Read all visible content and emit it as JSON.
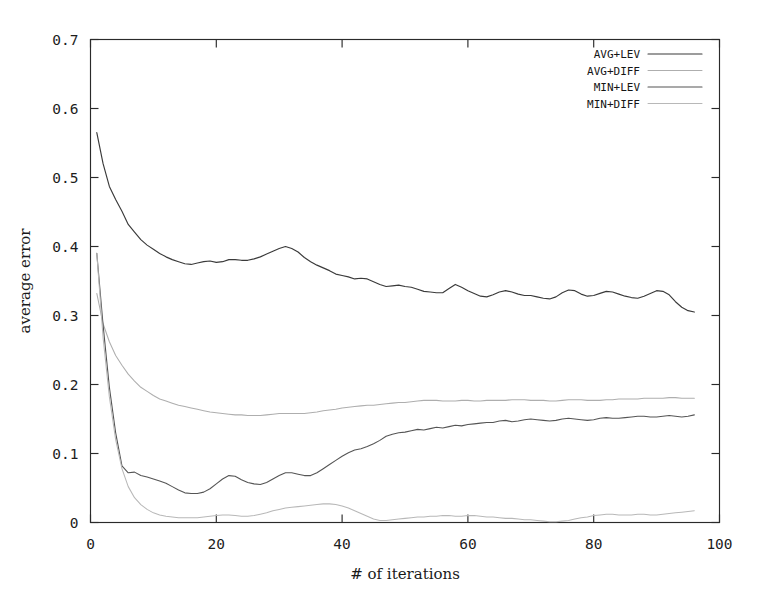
{
  "chart_data": {
    "type": "line",
    "title": "",
    "xlabel": "# of iterations",
    "ylabel": "average error",
    "xlim": [
      0,
      100
    ],
    "ylim": [
      0,
      0.7
    ],
    "xticks": [
      "0",
      "20",
      "40",
      "60",
      "80",
      "100"
    ],
    "xtick_values": [
      0,
      20,
      40,
      60,
      80,
      100
    ],
    "yticks": [
      "0",
      "0.1",
      "0.2",
      "0.3",
      "0.4",
      "0.5",
      "0.6",
      "0.7"
    ],
    "ytick_values": [
      0,
      0.1,
      0.2,
      0.3,
      0.4,
      0.5,
      0.6,
      0.7
    ],
    "grid": false,
    "legend_position": "top-right",
    "x": [
      1,
      2,
      3,
      4,
      5,
      6,
      7,
      8,
      9,
      10,
      11,
      12,
      13,
      14,
      15,
      16,
      17,
      18,
      19,
      20,
      21,
      22,
      23,
      24,
      25,
      26,
      27,
      28,
      29,
      30,
      31,
      32,
      33,
      34,
      35,
      36,
      37,
      38,
      39,
      40,
      41,
      42,
      43,
      44,
      45,
      46,
      47,
      48,
      49,
      50,
      51,
      52,
      53,
      54,
      55,
      56,
      57,
      58,
      59,
      60,
      61,
      62,
      63,
      64,
      65,
      66,
      67,
      68,
      69,
      70,
      71,
      72,
      73,
      74,
      75,
      76,
      77,
      78,
      79,
      80,
      81,
      82,
      83,
      84,
      85,
      86,
      87,
      88,
      89,
      90,
      91,
      92,
      93,
      94,
      95,
      96
    ],
    "series": [
      {
        "name": "AVG+LEV",
        "color": "#3a3a3a",
        "width": 1.15,
        "values": [
          0.565,
          0.52,
          0.487,
          0.468,
          0.451,
          0.432,
          0.421,
          0.41,
          0.402,
          0.396,
          0.39,
          0.385,
          0.381,
          0.378,
          0.375,
          0.374,
          0.376,
          0.378,
          0.379,
          0.377,
          0.378,
          0.381,
          0.381,
          0.38,
          0.38,
          0.382,
          0.385,
          0.389,
          0.393,
          0.397,
          0.4,
          0.397,
          0.392,
          0.384,
          0.378,
          0.373,
          0.369,
          0.365,
          0.36,
          0.358,
          0.356,
          0.353,
          0.354,
          0.353,
          0.349,
          0.345,
          0.342,
          0.343,
          0.344,
          0.342,
          0.341,
          0.338,
          0.335,
          0.334,
          0.333,
          0.333,
          0.339,
          0.345,
          0.341,
          0.336,
          0.332,
          0.328,
          0.327,
          0.33,
          0.334,
          0.336,
          0.334,
          0.331,
          0.329,
          0.329,
          0.327,
          0.325,
          0.324,
          0.327,
          0.333,
          0.337,
          0.336,
          0.331,
          0.328,
          0.329,
          0.332,
          0.335,
          0.334,
          0.331,
          0.328,
          0.326,
          0.325,
          0.328,
          0.332,
          0.336,
          0.335,
          0.33,
          0.32,
          0.312,
          0.307,
          0.305
        ]
      },
      {
        "name": "AVG+DIFF",
        "color": "#aeaeae",
        "width": 1.05,
        "values": [
          0.332,
          0.288,
          0.262,
          0.242,
          0.228,
          0.215,
          0.205,
          0.196,
          0.19,
          0.184,
          0.179,
          0.176,
          0.173,
          0.17,
          0.168,
          0.166,
          0.164,
          0.162,
          0.16,
          0.159,
          0.158,
          0.157,
          0.156,
          0.156,
          0.155,
          0.155,
          0.155,
          0.156,
          0.157,
          0.158,
          0.158,
          0.158,
          0.158,
          0.158,
          0.159,
          0.16,
          0.162,
          0.163,
          0.164,
          0.166,
          0.167,
          0.168,
          0.169,
          0.17,
          0.17,
          0.171,
          0.172,
          0.173,
          0.174,
          0.174,
          0.175,
          0.176,
          0.177,
          0.177,
          0.177,
          0.176,
          0.176,
          0.176,
          0.177,
          0.177,
          0.176,
          0.176,
          0.177,
          0.177,
          0.177,
          0.177,
          0.178,
          0.178,
          0.178,
          0.177,
          0.177,
          0.177,
          0.176,
          0.176,
          0.177,
          0.178,
          0.178,
          0.178,
          0.177,
          0.177,
          0.177,
          0.178,
          0.178,
          0.179,
          0.179,
          0.179,
          0.179,
          0.18,
          0.18,
          0.18,
          0.18,
          0.181,
          0.181,
          0.18,
          0.18,
          0.18
        ]
      },
      {
        "name": "MIN+LEV",
        "color": "#555555",
        "width": 1.1,
        "values": [
          0.39,
          0.286,
          0.196,
          0.13,
          0.082,
          0.072,
          0.073,
          0.068,
          0.066,
          0.063,
          0.06,
          0.057,
          0.052,
          0.047,
          0.043,
          0.042,
          0.042,
          0.044,
          0.049,
          0.056,
          0.063,
          0.068,
          0.067,
          0.062,
          0.058,
          0.056,
          0.055,
          0.058,
          0.063,
          0.068,
          0.072,
          0.072,
          0.07,
          0.068,
          0.068,
          0.072,
          0.078,
          0.084,
          0.09,
          0.096,
          0.101,
          0.105,
          0.107,
          0.11,
          0.114,
          0.119,
          0.125,
          0.128,
          0.13,
          0.131,
          0.133,
          0.135,
          0.134,
          0.136,
          0.138,
          0.137,
          0.139,
          0.141,
          0.14,
          0.142,
          0.143,
          0.144,
          0.145,
          0.145,
          0.147,
          0.148,
          0.146,
          0.147,
          0.149,
          0.15,
          0.149,
          0.148,
          0.147,
          0.148,
          0.15,
          0.151,
          0.15,
          0.149,
          0.148,
          0.149,
          0.151,
          0.152,
          0.151,
          0.151,
          0.152,
          0.153,
          0.154,
          0.154,
          0.153,
          0.153,
          0.154,
          0.155,
          0.154,
          0.153,
          0.154,
          0.156
        ]
      },
      {
        "name": "MIN+DIFF",
        "color": "#b8b8b8",
        "width": 1.05,
        "values": [
          0.39,
          0.268,
          0.182,
          0.12,
          0.078,
          0.052,
          0.036,
          0.026,
          0.019,
          0.014,
          0.011,
          0.009,
          0.008,
          0.007,
          0.007,
          0.007,
          0.007,
          0.008,
          0.009,
          0.01,
          0.011,
          0.011,
          0.01,
          0.009,
          0.009,
          0.01,
          0.012,
          0.014,
          0.017,
          0.019,
          0.021,
          0.022,
          0.023,
          0.024,
          0.025,
          0.026,
          0.027,
          0.027,
          0.026,
          0.024,
          0.021,
          0.017,
          0.013,
          0.009,
          0.005,
          0.003,
          0.003,
          0.004,
          0.005,
          0.006,
          0.007,
          0.008,
          0.008,
          0.009,
          0.009,
          0.01,
          0.01,
          0.009,
          0.009,
          0.01,
          0.01,
          0.009,
          0.008,
          0.008,
          0.007,
          0.006,
          0.006,
          0.005,
          0.004,
          0.004,
          0.003,
          0.002,
          0.001,
          0.001,
          0.002,
          0.003,
          0.005,
          0.007,
          0.008,
          0.01,
          0.011,
          0.012,
          0.012,
          0.011,
          0.011,
          0.011,
          0.012,
          0.012,
          0.011,
          0.011,
          0.012,
          0.013,
          0.014,
          0.015,
          0.016,
          0.017
        ]
      }
    ]
  },
  "legend": {
    "entries": [
      {
        "label": "AVG+LEV"
      },
      {
        "label": "AVG+DIFF"
      },
      {
        "label": "MIN+LEV"
      },
      {
        "label": "MIN+DIFF"
      }
    ]
  }
}
